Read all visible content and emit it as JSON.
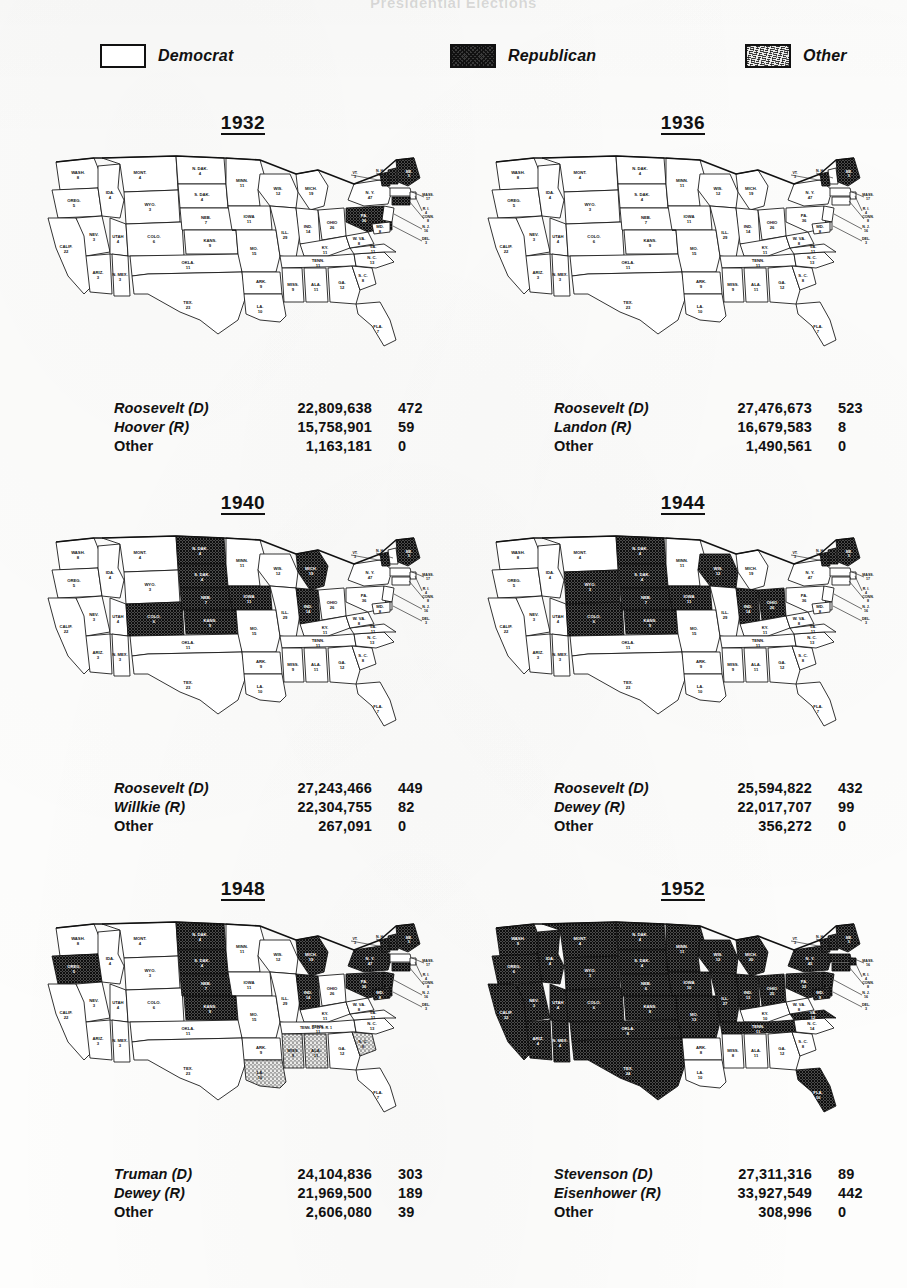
{
  "document": {
    "top_title_fragment": "Presidential Elections"
  },
  "legend": {
    "items": [
      {
        "label": "Democrat",
        "pattern": "white",
        "color": "#ffffff"
      },
      {
        "label": "Republican",
        "pattern": "crosshatch",
        "color": "#3a3a3a"
      },
      {
        "label": "Other",
        "pattern": "stipple",
        "color": "#e9e9e7"
      }
    ]
  },
  "elections": [
    {
      "year": "1932",
      "results": [
        {
          "candidate": "Roosevelt (D)",
          "popular": "22,809,638",
          "electoral": "472"
        },
        {
          "candidate": "Hoover (R)",
          "popular": "15,758,901",
          "electoral": "59"
        },
        {
          "candidate": "Other",
          "popular": "1,163,181",
          "electoral": "0"
        }
      ],
      "republican_states": [
        "PA",
        "ME",
        "VT",
        "NH",
        "CT",
        "DE"
      ],
      "other_states": []
    },
    {
      "year": "1936",
      "results": [
        {
          "candidate": "Roosevelt (D)",
          "popular": "27,476,673",
          "electoral": "523"
        },
        {
          "candidate": "Landon (R)",
          "popular": "16,679,583",
          "electoral": "8"
        },
        {
          "candidate": "Other",
          "popular": "1,490,561",
          "electoral": "0"
        }
      ],
      "republican_states": [
        "ME",
        "VT"
      ],
      "other_states": []
    },
    {
      "year": "1940",
      "results": [
        {
          "candidate": "Roosevelt (D)",
          "popular": "27,243,466",
          "electoral": "449"
        },
        {
          "candidate": "Willkie (R)",
          "popular": "22,304,755",
          "electoral": "82"
        },
        {
          "candidate": "Other",
          "popular": "267,091",
          "electoral": "0"
        }
      ],
      "republican_states": [
        "ND",
        "SD",
        "NE",
        "KS",
        "CO",
        "IA",
        "IN",
        "MI",
        "ME",
        "VT"
      ],
      "other_states": []
    },
    {
      "year": "1944",
      "results": [
        {
          "candidate": "Roosevelt (D)",
          "popular": "25,594,822",
          "electoral": "432"
        },
        {
          "candidate": "Dewey (R)",
          "popular": "22,017,707",
          "electoral": "99"
        },
        {
          "candidate": "Other",
          "popular": "356,272",
          "electoral": "0"
        }
      ],
      "republican_states": [
        "ND",
        "SD",
        "NE",
        "KS",
        "IA",
        "IN",
        "OH",
        "WY",
        "CO",
        "ME",
        "VT",
        "NH",
        "WI"
      ],
      "other_states": []
    },
    {
      "year": "1948",
      "results": [
        {
          "candidate": "Truman (D)",
          "popular": "24,104,836",
          "electoral": "303"
        },
        {
          "candidate": "Dewey (R)",
          "popular": "21,969,500",
          "electoral": "189"
        },
        {
          "candidate": "Other",
          "popular": "2,606,080",
          "electoral": "39"
        }
      ],
      "republican_states": [
        "OR",
        "ND",
        "SD",
        "NE",
        "KS",
        "IN",
        "MI",
        "PA",
        "NY",
        "NJ",
        "CT",
        "DE",
        "MD",
        "VT",
        "NH",
        "ME"
      ],
      "other_states": [
        "LA",
        "MS",
        "AL",
        "SC"
      ],
      "annotation": "TENN. D. 11 S. R. 1"
    },
    {
      "year": "1952",
      "results": [
        {
          "candidate": "Stevenson (D)",
          "popular": "27,311,316",
          "electoral": "89"
        },
        {
          "candidate": "Eisenhower (R)",
          "popular": "33,927,549",
          "electoral": "442"
        },
        {
          "candidate": "Other",
          "popular": "308,996",
          "electoral": "0"
        }
      ],
      "democrat_states": [
        "AR",
        "LA",
        "MS",
        "AL",
        "GA",
        "SC",
        "NC",
        "KY",
        "WV"
      ],
      "other_states": []
    }
  ],
  "states": [
    {
      "code": "WA",
      "label": "WASH.",
      "votes_1932": "8",
      "votes_1952": "9"
    },
    {
      "code": "OR",
      "label": "OREG.",
      "votes_1932": "5",
      "votes_1952": "6"
    },
    {
      "code": "CA",
      "label": "CALIF.",
      "votes_1932": "22",
      "votes_1952": "32"
    },
    {
      "code": "ID",
      "label": "IDA.",
      "votes_1932": "4",
      "votes_1952": "4"
    },
    {
      "code": "NV",
      "label": "NEV.",
      "votes_1932": "3",
      "votes_1952": "3"
    },
    {
      "code": "MT",
      "label": "MONT.",
      "votes_1932": "4",
      "votes_1952": "4"
    },
    {
      "code": "WY",
      "label": "WYO.",
      "votes_1932": "3",
      "votes_1952": "3"
    },
    {
      "code": "UT",
      "label": "UTAH",
      "votes_1932": "4",
      "votes_1952": "4"
    },
    {
      "code": "AZ",
      "label": "ARIZ.",
      "votes_1932": "3",
      "votes_1952": "4"
    },
    {
      "code": "CO",
      "label": "COLO.",
      "votes_1932": "6",
      "votes_1952": "6"
    },
    {
      "code": "NM",
      "label": "N. MEX.",
      "votes_1932": "3",
      "votes_1952": "4"
    },
    {
      "code": "ND",
      "label": "N. DAK.",
      "votes_1932": "4",
      "votes_1952": "4"
    },
    {
      "code": "SD",
      "label": "S. DAK.",
      "votes_1932": "4",
      "votes_1952": "4"
    },
    {
      "code": "NE",
      "label": "NEB.",
      "votes_1932": "7",
      "votes_1952": "6"
    },
    {
      "code": "KS",
      "label": "KANS.",
      "votes_1932": "9",
      "votes_1952": "8"
    },
    {
      "code": "OK",
      "label": "OKLA.",
      "votes_1932": "11",
      "votes_1952": "8"
    },
    {
      "code": "TX",
      "label": "TEX.",
      "votes_1932": "23",
      "votes_1952": "24"
    },
    {
      "code": "MN",
      "label": "MINN.",
      "votes_1932": "11",
      "votes_1952": "11"
    },
    {
      "code": "IA",
      "label": "IOWA",
      "votes_1932": "11",
      "votes_1952": "10"
    },
    {
      "code": "MO",
      "label": "MO.",
      "votes_1932": "15",
      "votes_1952": "13"
    },
    {
      "code": "AR",
      "label": "ARK.",
      "votes_1932": "9",
      "votes_1952": "8"
    },
    {
      "code": "LA",
      "label": "LA.",
      "votes_1932": "10",
      "votes_1952": "10"
    },
    {
      "code": "WI",
      "label": "WIS.",
      "votes_1932": "12",
      "votes_1952": "12"
    },
    {
      "code": "IL",
      "label": "ILL.",
      "votes_1932": "29",
      "votes_1952": "27"
    },
    {
      "code": "MI",
      "label": "MICH.",
      "votes_1932": "19",
      "votes_1952": "20"
    },
    {
      "code": "IN",
      "label": "IND.",
      "votes_1932": "14",
      "votes_1952": "13"
    },
    {
      "code": "OH",
      "label": "OHIO",
      "votes_1932": "26",
      "votes_1952": "25"
    },
    {
      "code": "KY",
      "label": "KY.",
      "votes_1932": "11",
      "votes_1952": "10"
    },
    {
      "code": "TN",
      "label": "TENN.",
      "votes_1932": "11",
      "votes_1952": "11"
    },
    {
      "code": "MS",
      "label": "MISS.",
      "votes_1932": "9",
      "votes_1952": "8"
    },
    {
      "code": "AL",
      "label": "ALA.",
      "votes_1932": "11",
      "votes_1952": "11"
    },
    {
      "code": "GA",
      "label": "GA.",
      "votes_1932": "12",
      "votes_1952": "12"
    },
    {
      "code": "FL",
      "label": "FLA.",
      "votes_1932": "7",
      "votes_1952": "10"
    },
    {
      "code": "SC",
      "label": "S. C.",
      "votes_1932": "8",
      "votes_1952": "8"
    },
    {
      "code": "NC",
      "label": "N. C.",
      "votes_1932": "13",
      "votes_1952": "14"
    },
    {
      "code": "VA",
      "label": "VA.",
      "votes_1932": "11",
      "votes_1952": "12"
    },
    {
      "code": "WV",
      "label": "W. VA.",
      "votes_1932": "8",
      "votes_1952": "8"
    },
    {
      "code": "PA",
      "label": "PA.",
      "votes_1932": "36",
      "votes_1952": "32"
    },
    {
      "code": "NY",
      "label": "N. Y.",
      "votes_1932": "47",
      "votes_1952": "45"
    },
    {
      "code": "VT",
      "label": "VT.",
      "votes_1932": "3",
      "votes_1952": "3"
    },
    {
      "code": "NH",
      "label": "N. H.",
      "votes_1932": "4",
      "votes_1952": "4"
    },
    {
      "code": "ME",
      "label": "ME.",
      "votes_1932": "5",
      "votes_1952": "5"
    },
    {
      "code": "MA",
      "label": "MASS.",
      "votes_1932": "17",
      "votes_1952": "16"
    },
    {
      "code": "RI",
      "label": "R. I.",
      "votes_1932": "4",
      "votes_1952": "4"
    },
    {
      "code": "CT",
      "label": "CONN.",
      "votes_1932": "8",
      "votes_1952": "8"
    },
    {
      "code": "NJ",
      "label": "N. J.",
      "votes_1932": "16",
      "votes_1952": "16"
    },
    {
      "code": "DE",
      "label": "DEL.",
      "votes_1932": "3",
      "votes_1952": "3"
    },
    {
      "code": "MD",
      "label": "MD.",
      "votes_1932": "8",
      "votes_1952": "9"
    }
  ]
}
